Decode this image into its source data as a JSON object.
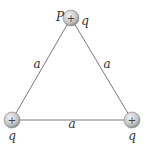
{
  "diagram": {
    "type": "equilateral-triangle-charges",
    "side_labels": {
      "left": "a",
      "right": "a",
      "bottom": "a"
    },
    "charges": [
      {
        "id": "top",
        "sign": "+",
        "charge_label": "q",
        "point_label": "P"
      },
      {
        "id": "bottom-left",
        "sign": "+",
        "charge_label": "q"
      },
      {
        "id": "bottom-right",
        "sign": "+",
        "charge_label": "q"
      }
    ],
    "colors": {
      "edge": "#777777",
      "charge_fill_center": "#f2f2f2",
      "charge_fill_edge": "#9a9a9a",
      "text": "#333333"
    }
  }
}
